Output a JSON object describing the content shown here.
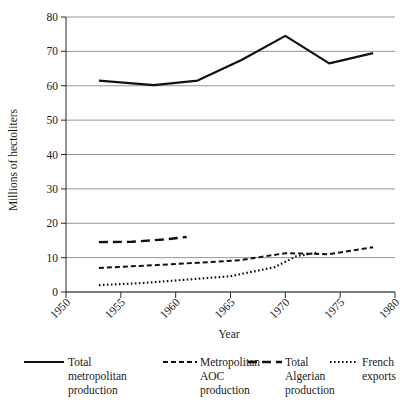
{
  "chart_data": {
    "type": "line",
    "title": "",
    "xlabel": "Year",
    "ylabel": "Millions of hectoliters",
    "xlim": [
      1950,
      1980
    ],
    "ylim": [
      0,
      80
    ],
    "xticks": [
      1950,
      1955,
      1960,
      1965,
      1970,
      1975,
      1980
    ],
    "yticks": [
      0,
      10,
      20,
      30,
      40,
      50,
      60,
      70,
      80
    ],
    "xtick_labels": [
      "1950",
      "1955",
      "1960",
      "1965",
      "1970",
      "1975",
      "1980"
    ],
    "ytick_labels": [
      "0",
      "10",
      "20",
      "30",
      "40",
      "50",
      "60",
      "70",
      "80"
    ],
    "grid": "horizontal",
    "legend_position": "bottom",
    "series": [
      {
        "name": "Total metropolitan production",
        "label_lines": [
          "Total",
          "metropolitan",
          "production"
        ],
        "style": "solid",
        "dasharray": "",
        "width": 2.2,
        "x": [
          1953,
          1958,
          1962,
          1966,
          1970,
          1974,
          1978
        ],
        "values": [
          61.5,
          60.2,
          61.5,
          67.5,
          74.5,
          66.5,
          69.5
        ]
      },
      {
        "name": "Metropolitan AOC production",
        "label_lines": [
          "Metropolitan",
          "AOC",
          "production"
        ],
        "style": "short-dash",
        "dasharray": "5,3",
        "width": 2.0,
        "x": [
          1953,
          1958,
          1962,
          1966,
          1970,
          1974,
          1978
        ],
        "values": [
          7.0,
          7.8,
          8.5,
          9.3,
          11.3,
          11.0,
          13.0
        ]
      },
      {
        "name": "Total Algerian production",
        "label_lines": [
          "Total",
          "Algerian",
          "production"
        ],
        "style": "long-dash",
        "dasharray": "9,5",
        "width": 2.4,
        "x": [
          1953,
          1956,
          1959,
          1961
        ],
        "values": [
          14.5,
          14.6,
          15.3,
          16.0
        ]
      },
      {
        "name": "French exports",
        "label_lines": [
          "French",
          "exports"
        ],
        "style": "dotted",
        "dasharray": "1.6,2.4",
        "width": 2.2,
        "x": [
          1953,
          1957,
          1961,
          1965,
          1969,
          1971,
          1973
        ],
        "values": [
          2.0,
          2.6,
          3.6,
          4.6,
          7.2,
          10.4,
          11.5
        ]
      }
    ]
  }
}
